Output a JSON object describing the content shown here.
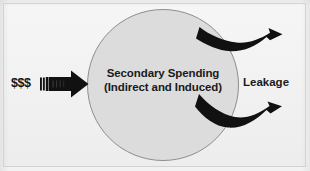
{
  "diagram": {
    "title_text": "Secondary Spending (Indirect and Induced)",
    "circle": {
      "name": "secondary-spending-circle",
      "label_line1": "Secondary Spending",
      "label_line2": "(Indirect and Induced)",
      "fill_color": "#dcdcdc",
      "stroke_color": "#8e8e8e"
    },
    "inflow": {
      "name": "money-inflow",
      "label": "$$$",
      "arrow_color": "#111111",
      "direction": "right"
    },
    "outflow": {
      "name": "leakage-outflow",
      "label": "Leakage",
      "arrow_color": "#111111",
      "arrow_count": 2,
      "directions": [
        "up-right",
        "down-right"
      ]
    },
    "background_color": "#f1f1f1",
    "frame_color": "#d3d3d3"
  }
}
